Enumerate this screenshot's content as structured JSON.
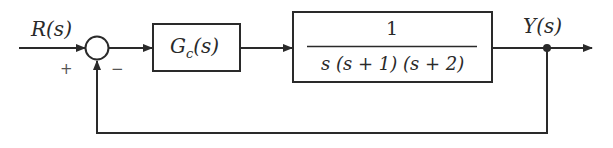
{
  "diagram": {
    "type": "feedback-control-block-diagram",
    "input_label": "R(s)",
    "output_label": "Y(s)",
    "summing_junction": {
      "plus_sign": "+",
      "minus_sign": "−"
    },
    "controller_block": {
      "name": "G",
      "subscript": "c",
      "arg": "(s)"
    },
    "plant_block": {
      "numerator": "1",
      "denominator": "s (s + 1) (s + 2)"
    },
    "feedback": "unity negative feedback",
    "colors": {
      "line": "#2a2a2a",
      "background": "#ffffff"
    }
  }
}
